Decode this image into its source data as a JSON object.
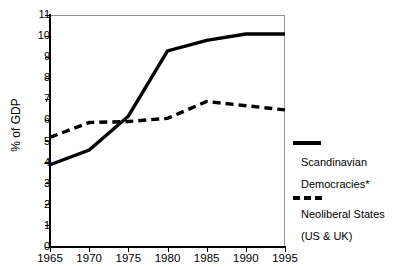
{
  "chart_data": {
    "type": "line",
    "title": "",
    "xlabel": "",
    "ylabel": "% of GDP",
    "x": [
      1965,
      1970,
      1975,
      1980,
      1985,
      1990,
      1995
    ],
    "xlim": [
      1965,
      1995
    ],
    "ylim": [
      0,
      11
    ],
    "xticks": [
      "1965",
      "1970",
      "1975",
      "1980",
      "1985",
      "1990",
      "1995"
    ],
    "yticks": [
      "0",
      "1",
      "2",
      "3",
      "4",
      "5",
      "6",
      "7",
      "8",
      "9",
      "10",
      "11"
    ],
    "grid": false,
    "legend_position": "right",
    "series": [
      {
        "name": "Scandinavian Democracies*",
        "style": "solid",
        "color": "#000000",
        "values": [
          3.9,
          4.6,
          6.2,
          9.3,
          9.8,
          10.1,
          10.1
        ]
      },
      {
        "name": "Neoliberal States (US & UK)",
        "style": "dashed",
        "color": "#000000",
        "values": [
          5.2,
          5.9,
          5.95,
          6.1,
          6.9,
          6.7,
          6.5
        ]
      }
    ]
  },
  "axes": {
    "y_title": "% of GDP",
    "y_tick_labels": [
      "11",
      "10",
      "9",
      "8",
      "7",
      "6",
      "5",
      "4",
      "3",
      "2",
      "1",
      "0"
    ],
    "x_tick_labels": [
      "1965",
      "1970",
      "1975",
      "1980",
      "1985",
      "1990",
      "1995"
    ]
  },
  "legend": {
    "solid_line_1": "Scandinavian",
    "solid_line_2": "Democracies*",
    "dashed_line_1": "Neoliberal States",
    "dashed_line_2": "(US & UK)"
  }
}
